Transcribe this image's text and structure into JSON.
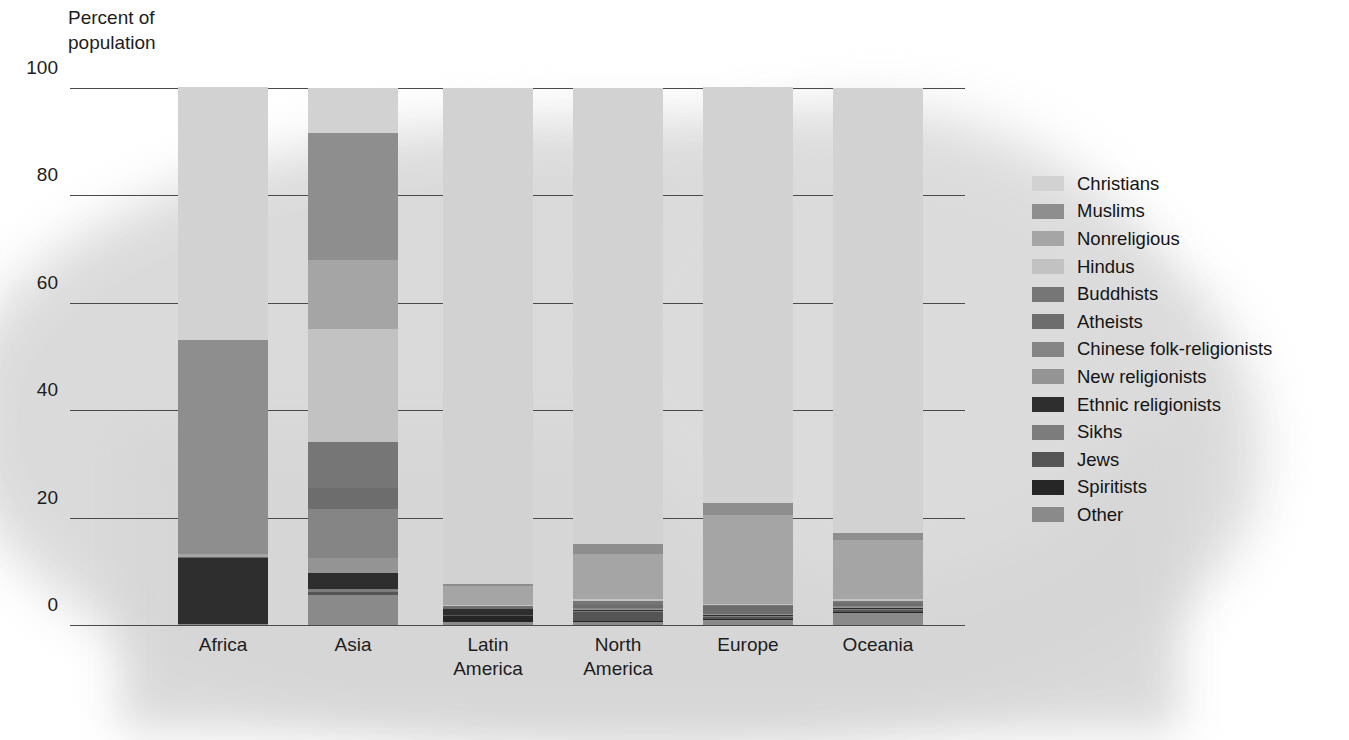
{
  "axis_title": "Percent of\npopulation",
  "legend": {
    "entries": [
      {
        "label": "Christians",
        "color": "#d2d2d2"
      },
      {
        "label": "Muslims",
        "color": "#8e8e8e"
      },
      {
        "label": "Nonreligious",
        "color": "#a5a5a5"
      },
      {
        "label": "Hindus",
        "color": "#c2c2c2"
      },
      {
        "label": "Buddhists",
        "color": "#767676"
      },
      {
        "label": "Atheists",
        "color": "#6d6d6d"
      },
      {
        "label": "Chinese folk-religionists",
        "color": "#858585"
      },
      {
        "label": "New religionists",
        "color": "#949494"
      },
      {
        "label": "Ethnic religionists",
        "color": "#2e2e2e"
      },
      {
        "label": "Sikhs",
        "color": "#7c7c7c"
      },
      {
        "label": "Jews",
        "color": "#555555"
      },
      {
        "label": "Spiritists",
        "color": "#262626"
      },
      {
        "label": "Other",
        "color": "#8a8a8a"
      }
    ]
  },
  "chart_data": {
    "type": "bar",
    "stacked": true,
    "title": "",
    "xlabel": "",
    "ylabel": "Percent of population",
    "ylim": [
      0,
      100
    ],
    "yticks": [
      0,
      20,
      40,
      60,
      80,
      100
    ],
    "ytick_labels": [
      "0",
      "20",
      "40",
      "60",
      "80",
      "100"
    ],
    "grid": true,
    "legend_position": "right",
    "categories": [
      "Africa",
      "Asia",
      "Latin\nAmerica",
      "North\nAmerica",
      "Europe",
      "Oceania"
    ],
    "category_labels": [
      "Africa",
      "Asia",
      "Latin America",
      "North America",
      "Europe",
      "Oceania"
    ],
    "series": [
      {
        "name": "Christians",
        "color": "#d2d2d2",
        "values": [
          47.0,
          8.5,
          92.5,
          85.0,
          77.5,
          83.0
        ]
      },
      {
        "name": "Muslims",
        "color": "#8e8e8e",
        "values": [
          40.0,
          23.5,
          0.4,
          1.8,
          2.2,
          1.2
        ]
      },
      {
        "name": "Nonreligious",
        "color": "#a5a5a5",
        "values": [
          0.4,
          13.0,
          3.5,
          8.5,
          16.5,
          11.0
        ]
      },
      {
        "name": "Hindus",
        "color": "#c2c2c2",
        "values": [
          0.1,
          21.0,
          0.2,
          0.4,
          0.2,
          0.4
        ]
      },
      {
        "name": "Buddhists",
        "color": "#767676",
        "values": [
          0.0,
          8.5,
          0.1,
          0.7,
          0.3,
          0.4
        ]
      },
      {
        "name": "Atheists",
        "color": "#6d6d6d",
        "values": [
          0.1,
          4.0,
          0.3,
          0.5,
          1.5,
          0.5
        ]
      },
      {
        "name": "Chinese folk-religionists",
        "color": "#858585",
        "values": [
          0.0,
          9.0,
          0.0,
          0.2,
          0.0,
          0.2
        ]
      },
      {
        "name": "New religionists",
        "color": "#949494",
        "values": [
          0.0,
          2.8,
          0.1,
          0.2,
          0.1,
          0.2
        ]
      },
      {
        "name": "Ethnic religionists",
        "color": "#2e2e2e",
        "values": [
          12.3,
          3.0,
          1.0,
          0.1,
          0.1,
          0.3
        ]
      },
      {
        "name": "Sikhs",
        "color": "#7c7c7c",
        "values": [
          0.0,
          0.6,
          0.0,
          0.1,
          0.1,
          0.1
        ]
      },
      {
        "name": "Jews",
        "color": "#555555",
        "values": [
          0.0,
          0.5,
          0.3,
          1.8,
          0.4,
          0.3
        ]
      },
      {
        "name": "Spiritists",
        "color": "#262626",
        "values": [
          0.0,
          0.1,
          1.0,
          0.2,
          0.1,
          0.1
        ]
      },
      {
        "name": "Other",
        "color": "#8a8a8a",
        "values": [
          0.1,
          5.5,
          0.6,
          0.5,
          1.0,
          2.3
        ]
      }
    ]
  }
}
